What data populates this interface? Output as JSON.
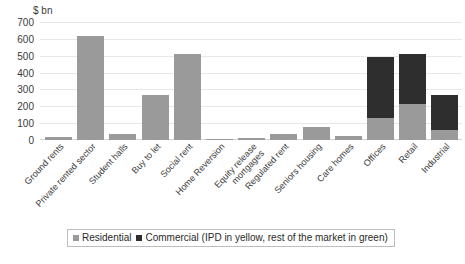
{
  "chart_data": {
    "type": "bar",
    "title": "",
    "subtitle": "",
    "xlabel": "",
    "ylabel": "$ bn",
    "ylim": [
      0,
      700
    ],
    "yticks": [
      0,
      100,
      200,
      300,
      400,
      500,
      600,
      700
    ],
    "grid": true,
    "stacked": true,
    "legend_position": "bottom",
    "categories": [
      "Ground rents",
      "Private rented sector",
      "Student halls",
      "Buy to let",
      "Social rent",
      "Home Reversion",
      "Equity release mortgages",
      "Regulated rent",
      "Seniors housing",
      "Care homes",
      "Offices",
      "Retail",
      "Industrial"
    ],
    "category_lines": [
      [
        "Ground rents"
      ],
      [
        "Private rented sector"
      ],
      [
        "Student halls"
      ],
      [
        "Buy to let"
      ],
      [
        "Social rent"
      ],
      [
        "Home Reversion"
      ],
      [
        "Equity release",
        "mortgages"
      ],
      [
        "Regulated rent"
      ],
      [
        "Seniors housing"
      ],
      [
        "Care homes"
      ],
      [
        "Offices"
      ],
      [
        "Retail"
      ],
      [
        "Industrial"
      ]
    ],
    "series": [
      {
        "name": "Residential",
        "color": "#9a9a9a",
        "values": [
          18,
          620,
          38,
          270,
          510,
          8,
          10,
          35,
          80,
          22,
          130,
          215,
          60
        ]
      },
      {
        "name": "Commercial (IPD in yellow, rest of the market in green)",
        "color": "#2e2e2e",
        "values": [
          0,
          0,
          0,
          0,
          0,
          0,
          0,
          0,
          0,
          0,
          360,
          295,
          205
        ]
      }
    ],
    "totals": [
      18,
      620,
      38,
      270,
      510,
      8,
      10,
      35,
      80,
      22,
      490,
      510,
      265
    ]
  },
  "legend": {
    "entries": [
      {
        "label": "Residential",
        "color": "#9a9a9a"
      },
      {
        "label": "Commercial (IPD in yellow, rest of the market in green)",
        "color": "#2e2e2e"
      }
    ]
  }
}
